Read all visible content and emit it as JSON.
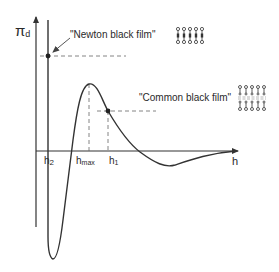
{
  "diagram": {
    "y_axis_label": "π",
    "y_axis_subscript": "d",
    "x_axis_label": "h",
    "tick_labels": {
      "h2": "h",
      "h2_sub": "2",
      "hmax": "h",
      "hmax_sub": "max",
      "h1": "h",
      "h1_sub": "1"
    },
    "annotations": {
      "newton": "\"Newton black film\"",
      "common": "\"Common black film\""
    },
    "icons": {
      "newton_film": "bilayer-molecules-icon",
      "common_film": "separated-bilayer-molecules-icon"
    },
    "colors": {
      "line": "#333333",
      "dash": "#666666",
      "background": "#ffffff"
    }
  }
}
